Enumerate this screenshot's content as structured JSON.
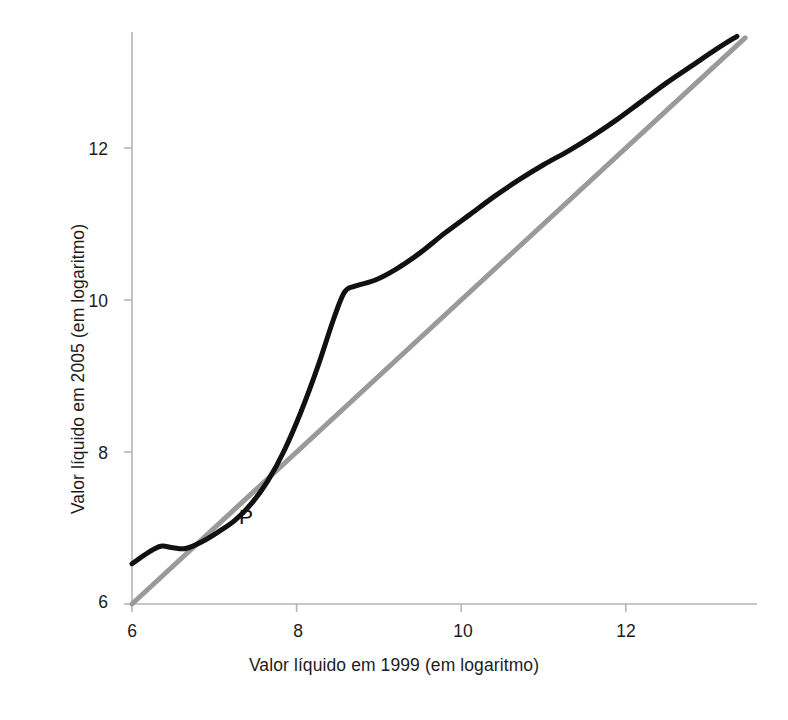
{
  "figure": {
    "background_color": "#ffffff",
    "width": 788,
    "height": 720
  },
  "chart_data": {
    "type": "line",
    "title": "",
    "xlabel": "Valor líquido em 1999 (em logaritmo)",
    "ylabel": "Valor líquido em 2005 (em logaritmo)",
    "xlim": [
      6,
      13.5
    ],
    "ylim": [
      6,
      13.5
    ],
    "xticks": [
      6,
      8,
      10,
      12
    ],
    "yticks": [
      6,
      8,
      10,
      12
    ],
    "xtick_labels": [
      "6",
      "8",
      "10",
      "12"
    ],
    "ytick_labels": [
      "6",
      "8",
      "10",
      "12"
    ],
    "grid": false,
    "legend": null,
    "annotations": [
      {
        "text": "P",
        "x": 7.35,
        "y": 7.15,
        "description": "label marking the crossing point of the curve and the 45-degree line"
      }
    ],
    "series": [
      {
        "name": "Valor líquido em 2005 observado",
        "color": "#111111",
        "line_width": 5,
        "style": "solid",
        "points": [
          [
            6.0,
            6.53
          ],
          [
            6.2,
            6.68
          ],
          [
            6.35,
            6.76
          ],
          [
            6.5,
            6.74
          ],
          [
            6.65,
            6.73
          ],
          [
            6.85,
            6.82
          ],
          [
            7.05,
            6.95
          ],
          [
            7.25,
            7.1
          ],
          [
            7.45,
            7.32
          ],
          [
            7.65,
            7.62
          ],
          [
            7.85,
            8.02
          ],
          [
            8.05,
            8.52
          ],
          [
            8.25,
            9.1
          ],
          [
            8.45,
            9.75
          ],
          [
            8.58,
            10.1
          ],
          [
            8.7,
            10.18
          ],
          [
            8.95,
            10.26
          ],
          [
            9.2,
            10.4
          ],
          [
            9.5,
            10.62
          ],
          [
            9.8,
            10.88
          ],
          [
            10.1,
            11.12
          ],
          [
            10.4,
            11.36
          ],
          [
            10.7,
            11.58
          ],
          [
            11.0,
            11.78
          ],
          [
            11.3,
            11.96
          ],
          [
            11.6,
            12.16
          ],
          [
            11.9,
            12.38
          ],
          [
            12.2,
            12.62
          ],
          [
            12.5,
            12.86
          ],
          [
            12.8,
            13.08
          ],
          [
            13.1,
            13.3
          ],
          [
            13.35,
            13.47
          ]
        ]
      },
      {
        "name": "Linha de 45 graus",
        "color": "#9a9a9a",
        "line_width": 5,
        "style": "solid",
        "points": [
          [
            6.0,
            6.0
          ],
          [
            13.45,
            13.45
          ]
        ]
      }
    ]
  },
  "axes": {
    "axis_color": "#b4b4b4",
    "tick_color": "#b4b4b4",
    "y_axis_label": "Valor líquido em 2005 (em logaritmo)",
    "x_axis_label": "Valor líquido em 1999 (em logaritmo)",
    "y_tick_labels": [
      {
        "value": "12"
      },
      {
        "value": "10"
      },
      {
        "value": "8"
      },
      {
        "value": "6"
      }
    ],
    "x_tick_labels": [
      {
        "value": "6"
      },
      {
        "value": "8"
      },
      {
        "value": "10"
      },
      {
        "value": "12"
      }
    ]
  },
  "annotation_p": "P"
}
